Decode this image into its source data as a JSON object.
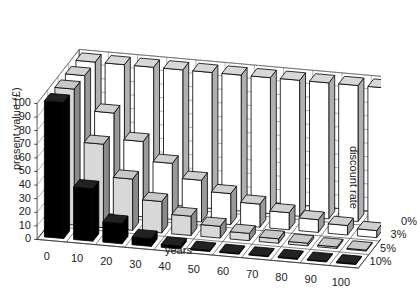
{
  "chart_data": {
    "type": "bar",
    "subtype": "3d-bar",
    "title": "",
    "xlabel": "years",
    "ylabel": "present value (£)",
    "zlabel": "discount rate",
    "categories": [
      "0",
      "10",
      "20",
      "30",
      "40",
      "50",
      "60",
      "70",
      "80",
      "90",
      "100"
    ],
    "yticks": [
      "0",
      "10",
      "20",
      "30",
      "40",
      "50",
      "60",
      "70",
      "80",
      "90",
      "100"
    ],
    "ylim": [
      0,
      100
    ],
    "grid": true,
    "series": [
      {
        "name": "10%",
        "color": "#000000",
        "values": [
          100,
          38.6,
          14.9,
          5.7,
          2.2,
          0.9,
          0.3,
          0.1,
          0.05,
          0.02,
          0.01
        ]
      },
      {
        "name": "5%",
        "color": "#d8d8d8",
        "values": [
          100,
          61.4,
          37.7,
          23.1,
          14.2,
          8.7,
          5.4,
          3.3,
          2.0,
          1.2,
          0.8
        ]
      },
      {
        "name": "3%",
        "color": "#ffffff",
        "values": [
          100,
          74.4,
          55.4,
          41.2,
          30.7,
          22.8,
          17.0,
          12.6,
          9.4,
          7.0,
          5.2
        ]
      },
      {
        "name": "0%",
        "color": "#ffffff",
        "values": [
          100,
          100,
          100,
          100,
          100,
          100,
          100,
          100,
          100,
          100,
          100
        ]
      }
    ],
    "legend_position": "depth-axis-right"
  }
}
